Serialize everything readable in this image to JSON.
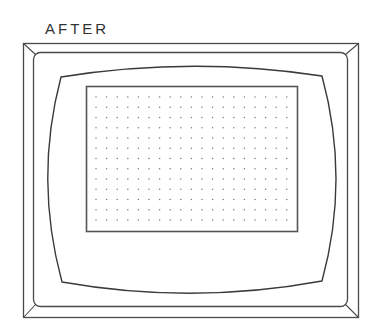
{
  "diagram": {
    "label": "AFTER",
    "stroke_color": "#4a4a4a",
    "dot_color": "#7a7a7a",
    "outer_frame": {
      "x": 23,
      "y": 43,
      "width": 336,
      "height": 275
    },
    "inner_frame": {
      "x": 33,
      "y": 52,
      "width": 315,
      "height": 255,
      "radius": 7
    },
    "screen_face": {
      "top_left": [
        61,
        77
      ],
      "top_right": [
        322,
        76
      ],
      "bottom_left": [
        62,
        282
      ],
      "bottom_right": [
        322,
        281
      ],
      "top_peak_y": 66,
      "bottom_peak_y": 293,
      "left_bulge_x": 48,
      "right_bulge_x": 336
    },
    "display_area": {
      "x": 86,
      "y": 86,
      "width": 211,
      "height": 145
    },
    "dot_grid": {
      "columns": 19,
      "rows": 13,
      "start_x": 96,
      "start_y": 97,
      "spacing_x": 10.6,
      "spacing_y": 10.25
    }
  }
}
